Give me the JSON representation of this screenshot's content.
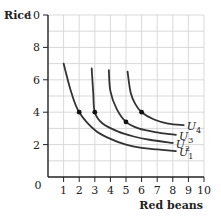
{
  "chart_data": {
    "type": "line",
    "title": "",
    "xlabel": "Red beans",
    "ylabel": "Rice",
    "xlim": [
      0,
      10
    ],
    "ylim": [
      0,
      10
    ],
    "x_ticks": [
      1,
      2,
      3,
      4,
      5,
      6,
      7,
      8,
      9,
      10
    ],
    "y_ticks": [
      0,
      2,
      4,
      6,
      8,
      10
    ],
    "origin_label": "0",
    "grid": true,
    "series": [
      {
        "name": "U1",
        "label_main": "U",
        "label_sub": "1",
        "points": [
          [
            1,
            7
          ],
          [
            1.5,
            5.2
          ],
          [
            2,
            4
          ],
          [
            3,
            2.9
          ],
          [
            4,
            2.35
          ],
          [
            5,
            2.0
          ],
          [
            6,
            1.8
          ],
          [
            7,
            1.7
          ],
          [
            8.2,
            1.6
          ]
        ],
        "marker": [
          2,
          4
        ]
      },
      {
        "name": "U2",
        "label_main": "U",
        "label_sub": "2",
        "points": [
          [
            2.8,
            6.7
          ],
          [
            2.9,
            5.2
          ],
          [
            3,
            4
          ],
          [
            3.5,
            3.3
          ],
          [
            4.5,
            2.8
          ],
          [
            5.5,
            2.5
          ],
          [
            6.5,
            2.3
          ],
          [
            8,
            2.1
          ]
        ],
        "marker": [
          3,
          4
        ]
      },
      {
        "name": "U3",
        "label_main": "U",
        "label_sub": "3",
        "points": [
          [
            3.9,
            6.6
          ],
          [
            4,
            5.3
          ],
          [
            4.4,
            4.2
          ],
          [
            5,
            3.4
          ],
          [
            5.8,
            3.0
          ],
          [
            7,
            2.75
          ],
          [
            8.2,
            2.6
          ]
        ],
        "marker": [
          5,
          3.4
        ]
      },
      {
        "name": "U4",
        "label_main": "U",
        "label_sub": "4",
        "points": [
          [
            5.1,
            6.5
          ],
          [
            5.3,
            5.2
          ],
          [
            5.6,
            4.5
          ],
          [
            6,
            4
          ],
          [
            6.8,
            3.55
          ],
          [
            7.7,
            3.3
          ],
          [
            8.7,
            3.2
          ]
        ],
        "marker": [
          6,
          4
        ]
      }
    ]
  }
}
